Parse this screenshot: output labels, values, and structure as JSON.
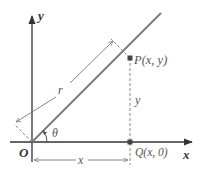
{
  "diagram": {
    "type": "polar-coordinates-figure",
    "colors": {
      "axis": "#333333",
      "ray": "#777777",
      "dashed": "#888888",
      "text": "#555555",
      "point": "#444444"
    },
    "axes": {
      "x_label": "x",
      "y_label": "y",
      "origin_label": "O"
    },
    "points": {
      "P": {
        "label": "P(x, y)"
      },
      "Q": {
        "label": "Q(x, 0)"
      }
    },
    "labels": {
      "radius": "r",
      "angle": "θ",
      "horizontal_distance": "x",
      "vertical_distance": "y"
    }
  }
}
